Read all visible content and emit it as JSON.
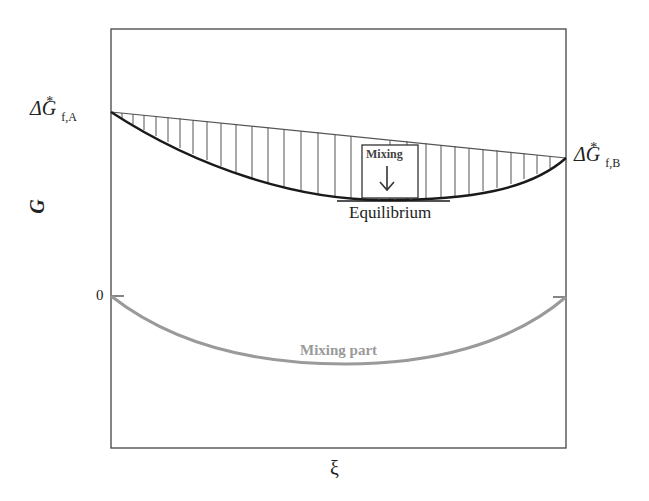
{
  "diagram": {
    "y_axis_label": "G",
    "x_axis_label": "ξ",
    "zero_tick_label": "0",
    "left_label": {
      "prefix": "ΔG",
      "superscript": "*",
      "subscript": "f,A"
    },
    "right_label": {
      "prefix": "ΔG",
      "superscript": "*",
      "subscript": "f,B"
    },
    "mixing_box_label": "Mixing",
    "mixing_arrow": "down-arrow",
    "equilibrium_label": "Equilibrium",
    "mixing_part_label": "Mixing part",
    "colors": {
      "frame": "#444444",
      "gibbs_curve": "#1a1a1a",
      "hatch": "#555555",
      "mixing_curve": "#9a9a9a",
      "mixing_part_text": "#9a9a9a"
    }
  }
}
